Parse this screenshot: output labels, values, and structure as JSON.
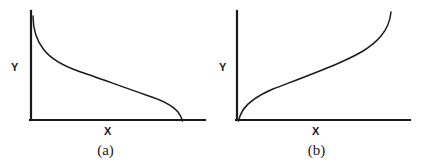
{
  "figure": {
    "background_color": "#ffffff",
    "ink_color": "#1a1a1a",
    "panels": [
      {
        "id": "a",
        "caption": "(a)",
        "xlabel": "X",
        "ylabel": "Y",
        "axis_origin": [
          31,
          120
        ],
        "y_axis_top": [
          31,
          11
        ],
        "x_axis_right": [
          205,
          120
        ],
        "curve_path": "M 33 16 C 33 30, 36 40, 44 50 C 52 60, 64 66, 78 71 C 96 77, 120 86, 146 95 C 162 100, 172 105, 178 112 C 181 116, 182 119, 182.5 121",
        "curve_description": "monotonically decreasing reverse-sigmoid: steep drop near the Y-axis, long gentle middle decline, steep drop to the X-axis at the right end"
      },
      {
        "id": "b",
        "caption": "(b)",
        "xlabel": "X",
        "ylabel": "Y",
        "axis_origin": [
          26,
          120
        ],
        "y_axis_top": [
          26,
          11
        ],
        "x_axis_right": [
          199,
          120
        ],
        "curve_path": "M 27.5 121 C 28 118, 29 115, 32 110 C 38 101, 48 95, 62 89 C 80 82, 105 73, 128 63 C 146 55, 160 48, 170 36 C 176 29, 179 22, 180 12",
        "curve_description": "monotonically increasing sigmoid: steep rise at the origin, long gentle middle climb, steep rise at the right end"
      }
    ]
  },
  "chart_data": [
    {
      "type": "line",
      "title": "(a)",
      "xlabel": "X",
      "ylabel": "Y",
      "grid": false,
      "legend": "none",
      "axis_ticks": [],
      "xlim": [
        0,
        1
      ],
      "ylim": [
        0,
        1
      ],
      "series": [
        {
          "name": "decreasing-curve",
          "x": [
            0.01,
            0.05,
            0.08,
            0.12,
            0.2,
            0.31,
            0.45,
            0.6,
            0.76,
            0.87,
            0.93,
            0.97,
            0.99
          ],
          "y": [
            0.96,
            0.78,
            0.7,
            0.64,
            0.58,
            0.53,
            0.46,
            0.38,
            0.29,
            0.22,
            0.14,
            0.06,
            0.0
          ]
        }
      ]
    },
    {
      "type": "line",
      "title": "(b)",
      "xlabel": "X",
      "ylabel": "Y",
      "grid": false,
      "legend": "none",
      "axis_ticks": [],
      "xlim": [
        0,
        1
      ],
      "ylim": [
        0,
        1
      ],
      "series": [
        {
          "name": "increasing-curve",
          "x": [
            0.01,
            0.04,
            0.08,
            0.14,
            0.22,
            0.34,
            0.48,
            0.62,
            0.75,
            0.84,
            0.89,
            0.92,
            0.94
          ],
          "y": [
            0.0,
            0.09,
            0.2,
            0.31,
            0.4,
            0.48,
            0.55,
            0.63,
            0.72,
            0.8,
            0.88,
            0.95,
            1.0
          ]
        }
      ]
    }
  ]
}
